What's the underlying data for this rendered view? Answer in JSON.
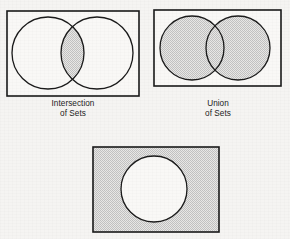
{
  "page": {
    "background_color": "#f5f4f2",
    "width": 290,
    "height": 239
  },
  "style": {
    "stroke_color": "#1a1a1a",
    "shade_color": "#d2d2d2",
    "unshaded_color": "#f7f6f4",
    "rect_stroke_width": 1.6,
    "circle_stroke_width": 1.3
  },
  "figures": [
    {
      "id": "intersection",
      "name": "intersection-of-sets-diagram",
      "caption_lines": [
        "Intersection",
        "of Sets"
      ],
      "shaded_region": "intersection",
      "rect": {
        "x": 7,
        "y": 11,
        "width": 132,
        "height": 85
      },
      "circles": [
        {
          "cx": 48,
          "cy": 53,
          "r": 36
        },
        {
          "cx": 97,
          "cy": 53,
          "r": 36
        }
      ],
      "caption_box": {
        "x": 17,
        "y": 99,
        "width": 112
      }
    },
    {
      "id": "union",
      "name": "union-of-sets-diagram",
      "caption_lines": [
        "Union",
        "of Sets"
      ],
      "shaded_region": "union",
      "rect": {
        "x": 154,
        "y": 10,
        "width": 127,
        "height": 76
      },
      "circles": [
        {
          "cx": 192,
          "cy": 48,
          "r": 32
        },
        {
          "cx": 238,
          "cy": 48,
          "r": 32
        }
      ],
      "caption_box": {
        "x": 162,
        "y": 99,
        "width": 112
      }
    },
    {
      "id": "complement",
      "name": "complement-of-set-diagram",
      "caption_lines": [],
      "shaded_region": "complement",
      "rect": {
        "x": 93,
        "y": 147,
        "width": 126,
        "height": 85
      },
      "circles": [
        {
          "cx": 154,
          "cy": 189,
          "r": 33
        }
      ],
      "caption_box": null
    }
  ]
}
